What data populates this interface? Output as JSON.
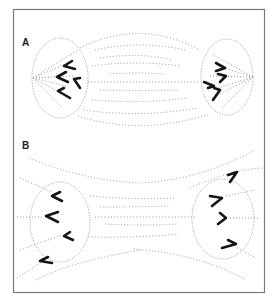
{
  "figure": {
    "panels": [
      {
        "label": "A",
        "description": "Metaphase-to-anaphase spindle with focused poles; chromosomes clustered near each pole"
      },
      {
        "label": "B",
        "description": "Spindle with unfocused, splayed poles; chromosomes spread along spindle"
      }
    ],
    "colors": {
      "frame": "#7a7a7a",
      "fiber": "#8a8a8a",
      "ellipse": "#8c8c8c",
      "chromosome": "#151515",
      "background": "#ffffff"
    }
  }
}
